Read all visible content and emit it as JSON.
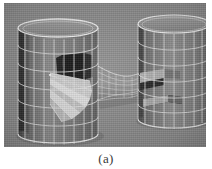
{
  "figure": {
    "caption": "(a)",
    "background_color": "#8f8f8f",
    "page_color": "#ffffff",
    "wire_color": "#e8e8e8",
    "dark_panel_color": "#171717",
    "light_wedge_color": "#dcdcdc",
    "mid_panel_color": "#6e6e6e",
    "plate": {
      "x": 4,
      "y": 3,
      "width": 202,
      "height": 144
    }
  },
  "scene": {
    "description": "Two wireframe cylinders joined by an hourglass-shaped mesh tube",
    "objects": [
      {
        "name": "left-cylinder",
        "label": "left cylinder",
        "center_x": 54,
        "top_y": 25,
        "bottom_y": 131,
        "radius_x": 40,
        "radius_y": 9,
        "grid_columns": 12,
        "grid_rows": 6,
        "feature": "radiating light fan with dark wedge panels"
      },
      {
        "name": "right-cylinder",
        "label": "right cylinder",
        "center_x": 170,
        "top_y": 21,
        "bottom_y": 116,
        "radius_x": 36,
        "radius_y": 9,
        "grid_columns": 12,
        "grid_rows": 6,
        "feature": "horizontal rectangular slot / notch"
      },
      {
        "name": "connecting-tube",
        "label": "connecting hyperboloid tube",
        "left_x": 92,
        "right_x": 148,
        "waist_x": 120,
        "feature": "hourglass wireframe mesh"
      }
    ]
  }
}
